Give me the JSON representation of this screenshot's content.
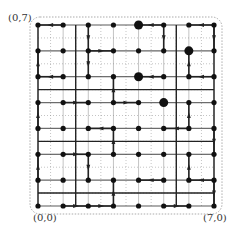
{
  "labels": {
    "top_left": "(0,7)",
    "bottom_left": "(0,0)",
    "bottom_right": "(7,0)"
  },
  "colors": {
    "edge": "#222222",
    "grid": "#9a9a9a",
    "node": "#111111",
    "dotted": "#888888"
  },
  "grid_size": 8,
  "large_nodes": [
    [
      4,
      7
    ],
    [
      6,
      6
    ],
    [
      4,
      5
    ],
    [
      5,
      4
    ]
  ],
  "edges": [
    {
      "from": [
        1,
        7
      ],
      "to": [
        0,
        7
      ]
    },
    {
      "from": [
        2,
        7
      ],
      "to": [
        2,
        6
      ]
    },
    {
      "from": [
        5,
        7
      ],
      "to": [
        4,
        7
      ]
    },
    {
      "from": [
        5,
        7
      ],
      "to": [
        5,
        6
      ]
    },
    {
      "from": [
        7,
        7
      ],
      "to": [
        6,
        7
      ]
    },
    {
      "from": [
        7,
        7
      ],
      "to": [
        7,
        6
      ]
    },
    {
      "from": [
        2,
        6
      ],
      "to": [
        3,
        6
      ]
    },
    {
      "from": [
        0,
        5
      ],
      "to": [
        0,
        6
      ]
    },
    {
      "from": [
        2,
        6
      ],
      "to": [
        2,
        5
      ]
    },
    {
      "from": [
        6,
        5
      ],
      "to": [
        6,
        6
      ]
    },
    {
      "from": [
        5,
        5
      ],
      "to": [
        4,
        5
      ]
    },
    {
      "from": [
        7,
        5
      ],
      "to": [
        6,
        5
      ]
    },
    {
      "from": [
        3,
        4
      ],
      "to": [
        3,
        5
      ]
    },
    {
      "from": [
        1,
        5
      ],
      "to": [
        0,
        5
      ]
    },
    {
      "from": [
        0,
        3
      ],
      "to": [
        0,
        4
      ]
    },
    {
      "from": [
        1,
        4
      ],
      "to": [
        2,
        4
      ]
    },
    {
      "from": [
        3,
        4
      ],
      "to": [
        4,
        4
      ]
    },
    {
      "from": [
        6,
        3
      ],
      "to": [
        6,
        4
      ]
    },
    {
      "from": [
        3,
        3
      ],
      "to": [
        2,
        3
      ]
    },
    {
      "from": [
        3,
        2
      ],
      "to": [
        3,
        3
      ]
    },
    {
      "from": [
        6,
        3
      ],
      "to": [
        5,
        3
      ]
    },
    {
      "from": [
        1,
        2
      ],
      "to": [
        2,
        2
      ]
    },
    {
      "from": [
        7,
        3
      ],
      "to": [
        7,
        2
      ]
    },
    {
      "from": [
        0,
        1
      ],
      "to": [
        0,
        2
      ]
    },
    {
      "from": [
        2,
        2
      ],
      "to": [
        2,
        1
      ]
    },
    {
      "from": [
        6,
        1
      ],
      "to": [
        6,
        2
      ]
    },
    {
      "from": [
        5,
        1
      ],
      "to": [
        4,
        1
      ]
    },
    {
      "from": [
        7,
        1
      ],
      "to": [
        6,
        1
      ]
    },
    {
      "from": [
        3,
        0
      ],
      "to": [
        3,
        1
      ]
    },
    {
      "from": [
        7,
        1
      ],
      "to": [
        7,
        0
      ]
    },
    {
      "from": [
        1,
        0
      ],
      "to": [
        2,
        0
      ]
    },
    {
      "from": [
        2,
        0
      ],
      "to": [
        3,
        0
      ]
    },
    {
      "from": [
        5,
        0
      ],
      "to": [
        6,
        0
      ]
    }
  ],
  "long_lines": [
    {
      "from": [
        0,
        4.5
      ],
      "to": [
        7,
        4.5
      ]
    },
    {
      "from": [
        0,
        2.5
      ],
      "to": [
        7,
        2.5
      ]
    },
    {
      "from": [
        0,
        0.5
      ],
      "to": [
        7,
        0.5
      ]
    },
    {
      "from": [
        1.5,
        7
      ],
      "to": [
        1.5,
        0
      ]
    },
    {
      "from": [
        5.5,
        7
      ],
      "to": [
        5.5,
        0
      ]
    }
  ]
}
